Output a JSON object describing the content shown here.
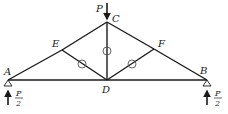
{
  "diagram": {
    "type": "truss",
    "colors": {
      "member": "#1a1a1a",
      "zero_marker": "#555555",
      "background": "#ffffff"
    },
    "nodes": {
      "A": {
        "label": "A",
        "x": 8,
        "y": 80
      },
      "B": {
        "label": "B",
        "x": 207,
        "y": 80
      },
      "C": {
        "label": "C",
        "x": 107,
        "y": 22
      },
      "D": {
        "label": "D",
        "x": 107,
        "y": 80
      },
      "E": {
        "label": "E",
        "x": 62,
        "y": 50
      },
      "F": {
        "label": "F",
        "x": 154,
        "y": 49
      }
    },
    "members": [
      "A-E",
      "E-C",
      "C-F",
      "F-B",
      "A-D",
      "D-B",
      "C-D",
      "E-D",
      "F-D"
    ],
    "zero_force_markers": [
      "C-D",
      "E-D",
      "F-D"
    ],
    "loads": {
      "top": {
        "label": "P",
        "node": "C",
        "direction": "down"
      },
      "left_reaction": {
        "numerator": "P",
        "denominator": "2",
        "node": "A",
        "direction": "up"
      },
      "right_reaction": {
        "numerator": "P",
        "denominator": "2",
        "node": "B",
        "direction": "up"
      }
    },
    "supports": [
      "A",
      "B"
    ]
  }
}
